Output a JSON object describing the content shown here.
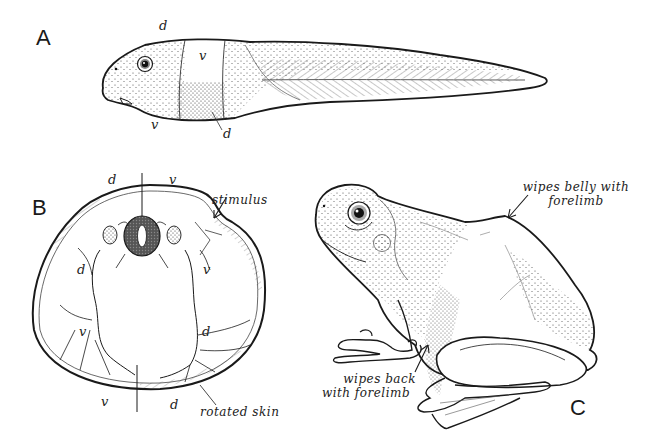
{
  "figure": {
    "panels": [
      {
        "id": "A",
        "letter": "A",
        "subject": "tadpole, lateral view",
        "labels": {
          "d_top": "d",
          "v_band": "v",
          "v_bottom": "v",
          "d_band": "d"
        }
      },
      {
        "id": "B",
        "letter": "B",
        "subject": "tadpole cross-section",
        "labels": {
          "d_top_left": "d",
          "v_top_right": "v",
          "d_left": "d",
          "v_right": "v",
          "v_lower_left": "v",
          "d_lower_right": "d",
          "v_bottom": "v",
          "d_bottom": "d"
        },
        "annotations": {
          "stimulus": "stimulus",
          "rotated_skin": "rotated skin"
        }
      },
      {
        "id": "C",
        "letter": "C",
        "subject": "adult frog, lateral view",
        "annotations": {
          "belly_line1": "wipes belly with",
          "belly_line2": "forelimb",
          "back_line1": "wipes back",
          "back_line2": "with forelimb"
        }
      }
    ],
    "colors": {
      "ink": "#1a1a1a",
      "background": "#ffffff",
      "stipple": "#555555"
    }
  }
}
